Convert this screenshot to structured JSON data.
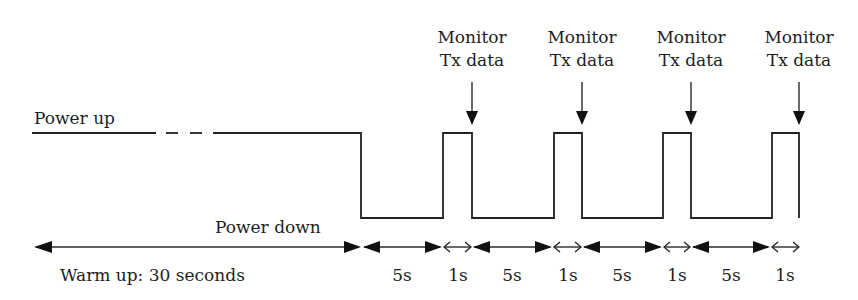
{
  "diagram": {
    "type": "timing-diagram",
    "labels": {
      "power_up": "Power up",
      "power_down": "Power down",
      "warm_up": "Warm up: 30 seconds"
    },
    "monitor_markers": [
      {
        "line1": "Monitor",
        "line2": "Tx data"
      },
      {
        "line1": "Monitor",
        "line2": "Tx data"
      },
      {
        "line1": "Monitor",
        "line2": "Tx data"
      },
      {
        "line1": "Monitor",
        "line2": "Tx data"
      }
    ],
    "intervals": [
      {
        "label": "5s"
      },
      {
        "label": "1s"
      },
      {
        "label": "5s"
      },
      {
        "label": "1s"
      },
      {
        "label": "5s"
      },
      {
        "label": "1s"
      },
      {
        "label": "5s"
      },
      {
        "label": "1s"
      }
    ],
    "colors": {
      "line": "#222222",
      "text": "#1e1e1e",
      "background": "#ffffff"
    }
  }
}
